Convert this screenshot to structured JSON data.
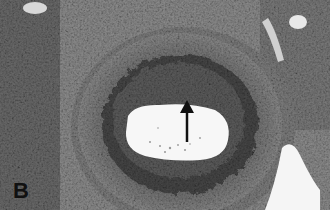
{
  "figure": {
    "panel_label": "B",
    "annotation": {
      "type": "arrow",
      "direction": "up",
      "color": "#111111"
    },
    "colors": {
      "background": "#fafafa",
      "tissue_dark": "#3a3a3a",
      "tissue_mid": "#7a7a7a",
      "tissue_light": "#b0b0b0",
      "lumen": "#f7f7f7"
    }
  }
}
